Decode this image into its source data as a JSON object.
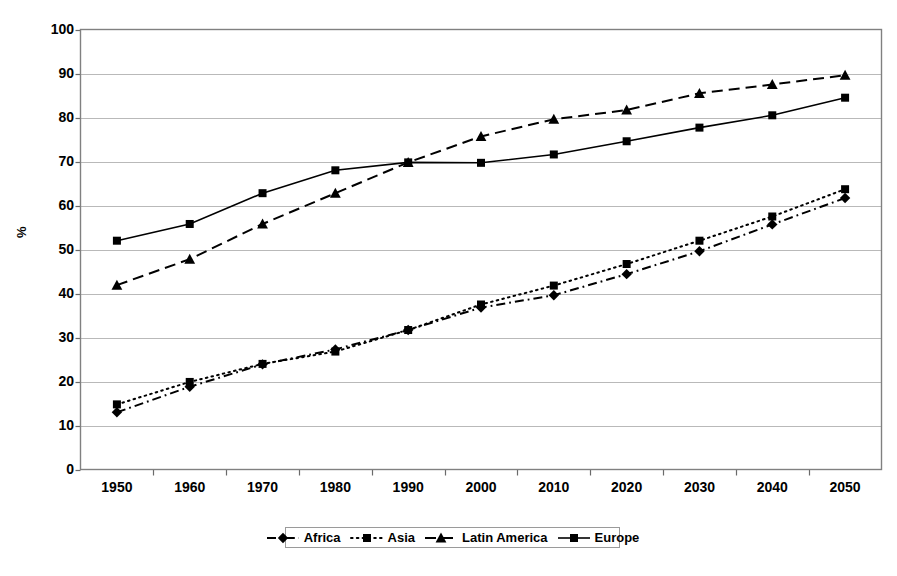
{
  "chart_data": {
    "type": "line",
    "title": "",
    "xlabel": "",
    "ylabel": "%",
    "categories": [
      "1950",
      "1960",
      "1970",
      "1980",
      "1990",
      "2000",
      "2010",
      "2020",
      "2030",
      "2040",
      "2050"
    ],
    "ylim": [
      0,
      100
    ],
    "ytick_values": [
      0,
      10,
      20,
      30,
      40,
      50,
      60,
      70,
      80,
      90,
      100
    ],
    "grid": "horizontal",
    "legend_position": "bottom-center",
    "series": [
      {
        "name": "Africa",
        "marker": "diamond",
        "linestyle": "dash-dot",
        "color": "#000000",
        "values": [
          13.0,
          18.8,
          23.9,
          27.3,
          31.7,
          36.8,
          39.6,
          44.4,
          49.6,
          55.7,
          61.7
        ]
      },
      {
        "name": "Asia",
        "marker": "square",
        "linestyle": "dotted",
        "color": "#000000",
        "values": [
          14.8,
          19.9,
          24.0,
          26.8,
          31.7,
          37.5,
          41.8,
          46.7,
          52.0,
          57.5,
          63.7
        ]
      },
      {
        "name": "Latin America",
        "marker": "triangle",
        "linestyle": "dashed",
        "color": "#000000",
        "values": [
          41.9,
          47.8,
          55.8,
          62.8,
          69.8,
          75.7,
          79.6,
          81.7,
          85.5,
          87.5,
          89.6
        ]
      },
      {
        "name": "Europe",
        "marker": "square",
        "linestyle": "solid",
        "color": "#000000",
        "values": [
          52.0,
          55.8,
          62.8,
          68.0,
          69.8,
          69.7,
          71.6,
          74.6,
          77.7,
          80.5,
          84.5
        ]
      }
    ]
  },
  "axis": {
    "y_label": "%"
  }
}
